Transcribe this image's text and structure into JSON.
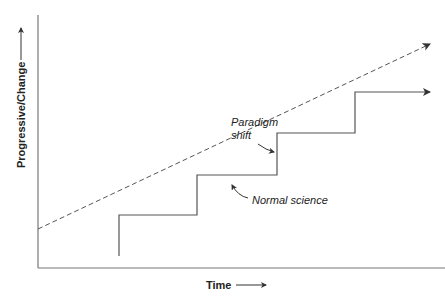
{
  "diagram": {
    "type": "staircase-progress",
    "y_axis_label": "Progressive/Change",
    "x_axis_label": "Time",
    "annotations": [
      {
        "text_lines": [
          "Paradigm",
          "shift"
        ],
        "points_to": "vertical step (paradigm shift)"
      },
      {
        "text": "Normal science",
        "points_to": "horizontal plateau (normal science)"
      }
    ],
    "series": [
      {
        "name": "trend",
        "style": "dashed",
        "description": "steady linear progress"
      },
      {
        "name": "staircase",
        "style": "solid",
        "description": "plateaus of normal science punctuated by paradigm shifts",
        "steps": 4
      }
    ],
    "colors": {
      "line": "#555555",
      "text": "#222222"
    }
  }
}
